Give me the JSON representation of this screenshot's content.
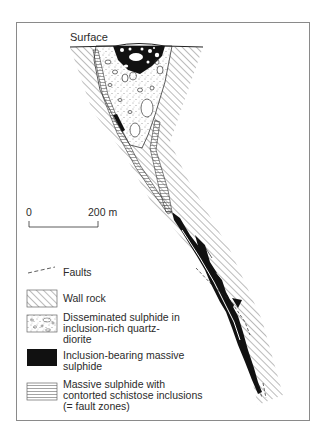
{
  "figure": {
    "surface_label": "Surface",
    "scale_bar": {
      "start": "0",
      "end": "200 m"
    },
    "colors": {
      "ink": "#1a1a1a",
      "frame": "#8a8a8a",
      "paper": "#ffffff"
    }
  },
  "legend": {
    "faults": "Faults",
    "items": [
      {
        "pattern": "diagonal-hatch",
        "lines": [
          "Wall rock"
        ]
      },
      {
        "pattern": "stipple-with-clasts",
        "lines": [
          "Disseminated sulphide in",
          "inclusion-rich quartz-",
          "diorite"
        ]
      },
      {
        "pattern": "solid-black",
        "lines": [
          "Inclusion-bearing massive",
          "sulphide"
        ]
      },
      {
        "pattern": "horizontal-lines",
        "lines": [
          "Massive sulphide with",
          "contorted schistose inclusions",
          "(= fault zones)"
        ]
      }
    ]
  }
}
